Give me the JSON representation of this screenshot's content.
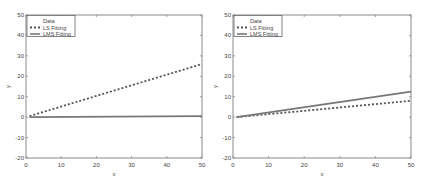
{
  "chart_data": [
    {
      "type": "line",
      "title": "",
      "xlabel": "x",
      "ylabel": "y",
      "xlim": [
        0,
        50
      ],
      "ylim": [
        -20,
        50
      ],
      "xticks": [
        0,
        10,
        20,
        30,
        40,
        50
      ],
      "yticks": [
        -20,
        -10,
        0,
        10,
        20,
        30,
        40,
        50
      ],
      "grid": false,
      "legend": {
        "position": "upper-left",
        "entries": [
          "Data",
          "LS Fitting",
          "LMS Fitting"
        ]
      },
      "series": [
        {
          "name": "Data",
          "style": "markers",
          "x": [],
          "y": []
        },
        {
          "name": "LS Fitting",
          "style": "dotted",
          "x": [
            1,
            50
          ],
          "y": [
            0.5,
            26
          ]
        },
        {
          "name": "LMS Fitting",
          "style": "solid",
          "x": [
            1,
            50
          ],
          "y": [
            0,
            0.5
          ]
        }
      ]
    },
    {
      "type": "line",
      "title": "",
      "xlabel": "x",
      "ylabel": "y",
      "xlim": [
        0,
        50
      ],
      "ylim": [
        -20,
        50
      ],
      "xticks": [
        0,
        10,
        20,
        30,
        40,
        50
      ],
      "yticks": [
        -20,
        -10,
        0,
        10,
        20,
        30,
        40,
        50
      ],
      "grid": false,
      "legend": {
        "position": "upper-left",
        "entries": [
          "Data",
          "LS Fitting",
          "LMS Fitting"
        ]
      },
      "series": [
        {
          "name": "Data",
          "style": "markers",
          "x": [],
          "y": []
        },
        {
          "name": "LS Fitting",
          "style": "dotted",
          "x": [
            1,
            50
          ],
          "y": [
            0,
            8
          ]
        },
        {
          "name": "LMS Fitting",
          "style": "solid",
          "x": [
            1,
            50
          ],
          "y": [
            0,
            12.5
          ]
        }
      ]
    }
  ]
}
